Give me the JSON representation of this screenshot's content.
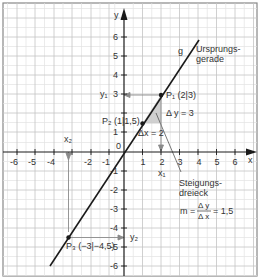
{
  "diagram": {
    "axes": {
      "x_label": "x",
      "y_label": "y",
      "origin_label": "0",
      "x_ticks": [
        "-6",
        "-5",
        "-4",
        "-3",
        "-2",
        "-1",
        "1",
        "2",
        "3",
        "4",
        "5",
        "6"
      ],
      "y_ticks": [
        "6",
        "5",
        "4",
        "3",
        "2",
        "1",
        "-1",
        "-2",
        "-3",
        "-4",
        "-5",
        "-6"
      ]
    },
    "line": {
      "name": "g",
      "label_line1": "Ursprungs-",
      "label_line2": "gerade",
      "color": "#1a1a1a"
    },
    "points": [
      {
        "name": "P1",
        "label": "P₁ (2|3)",
        "x": 2,
        "y": 3
      },
      {
        "name": "P2",
        "label": "P₂ (1|1,5)",
        "x": 1,
        "y": 1.5
      },
      {
        "name": "P3",
        "label": "P₃ (−3|−4,5)",
        "x": -3,
        "y": -4.5
      }
    ],
    "projection_labels": {
      "x1": "x₁",
      "x2": "x₂",
      "y1": "y₁",
      "y2": "y₂"
    },
    "slope_triangle": {
      "delta_y": "Δ y = 3",
      "delta_x": "Δx = 2",
      "title_line1": "Steigungs-",
      "title_line2": "dreieck",
      "formula_m": "m =",
      "formula_num": "Δ y",
      "formula_den": "Δ x",
      "formula_value": "= 1,5",
      "fill_color": "#c8c8c8"
    },
    "colors": {
      "grid_major": "#c4c4c4",
      "grid_minor": "#e2e2e2",
      "axis": "#1a1a1a",
      "projection": "#8a8a8a"
    }
  }
}
